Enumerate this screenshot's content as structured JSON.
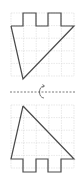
{
  "diagram": {
    "colors": {
      "background": "#ffffff",
      "grid": "#d9d9d9",
      "shape_stroke": "#4a4a4a",
      "axis": "#555555"
    },
    "top_figure": {
      "grid": {
        "x0": 11,
        "y0": 13,
        "cell": 12.6,
        "cols": 5,
        "rows": 5
      },
      "shape_points": "11,26 23,26 23,13 36,13 36,26 48,26 48,13 61,13 61,26 74,26 23,79 11,26"
    },
    "mirror_line": {
      "y": 92,
      "x1": 10,
      "x2": 76,
      "style": "dashed"
    },
    "rotation_icon": {
      "name": "rotate-arrow-icon",
      "x": 42,
      "y": 92
    },
    "bottom_figure": {
      "grid": {
        "x0": 11,
        "y0": 105,
        "cell": 12.6,
        "cols": 5,
        "rows": 5
      },
      "shape_points": "23,106 74,159 61,159 61,172 48,172 48,159 36,159 36,172 23,172 23,159 11,159 23,106"
    }
  }
}
